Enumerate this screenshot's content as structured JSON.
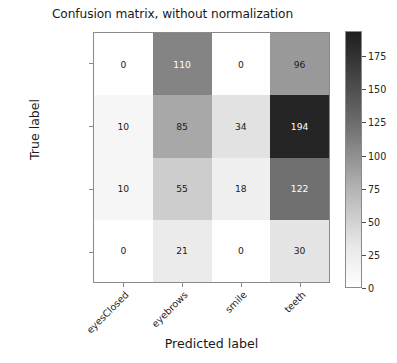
{
  "chart_data": {
    "type": "heatmap",
    "title": "Confusion matrix, without normalization",
    "xlabel": "Predicted label",
    "ylabel": "True label",
    "categories": [
      "eyesClosed",
      "eyebrows",
      "smile",
      "teeth"
    ],
    "x_tick_labels": [
      "eyesClosed",
      "eyebrows",
      "smile",
      "teeth"
    ],
    "y_tick_labels": [
      "eyesClosed",
      "eyebrows",
      "smile",
      "teeth"
    ],
    "rows": [
      {
        "label": "eyesClosed",
        "values": [
          0,
          110,
          0,
          96
        ]
      },
      {
        "label": "eyebrows",
        "values": [
          10,
          85,
          34,
          194
        ]
      },
      {
        "label": "smile",
        "values": [
          10,
          55,
          18,
          122
        ]
      },
      {
        "label": "teeth",
        "values": [
          0,
          21,
          0,
          30
        ]
      }
    ],
    "cells": [
      {
        "row": 0,
        "col": 0,
        "value": 0,
        "text": "0",
        "bg": "#fefefe",
        "fg": "#1a1a1a"
      },
      {
        "row": 0,
        "col": 1,
        "value": 110,
        "text": "110",
        "bg": "#848484",
        "fg": "#ffffff"
      },
      {
        "row": 0,
        "col": 2,
        "value": 0,
        "text": "0",
        "bg": "#fefefe",
        "fg": "#1a1a1a"
      },
      {
        "row": 0,
        "col": 3,
        "value": 96,
        "text": "96",
        "bg": "#999999",
        "fg": "#1a1a1a"
      },
      {
        "row": 1,
        "col": 0,
        "value": 10,
        "text": "10",
        "bg": "#f6f6f6",
        "fg": "#1a1a1a"
      },
      {
        "row": 1,
        "col": 1,
        "value": 85,
        "text": "85",
        "bg": "#a8a8a8",
        "fg": "#1a1a1a"
      },
      {
        "row": 1,
        "col": 2,
        "value": 34,
        "text": "34",
        "bg": "#e2e2e2",
        "fg": "#1a1a1a"
      },
      {
        "row": 1,
        "col": 3,
        "value": 194,
        "text": "194",
        "bg": "#252525",
        "fg": "#ffffff"
      },
      {
        "row": 2,
        "col": 0,
        "value": 10,
        "text": "10",
        "bg": "#f6f6f6",
        "fg": "#1a1a1a"
      },
      {
        "row": 2,
        "col": 1,
        "value": 55,
        "text": "55",
        "bg": "#cdcdcd",
        "fg": "#1a1a1a"
      },
      {
        "row": 2,
        "col": 2,
        "value": 18,
        "text": "18",
        "bg": "#efefef",
        "fg": "#1a1a1a"
      },
      {
        "row": 2,
        "col": 3,
        "value": 122,
        "text": "122",
        "bg": "#707070",
        "fg": "#ffffff"
      },
      {
        "row": 3,
        "col": 0,
        "value": 0,
        "text": "0",
        "bg": "#fefefe",
        "fg": "#1a1a1a"
      },
      {
        "row": 3,
        "col": 1,
        "value": 21,
        "text": "21",
        "bg": "#ebebeb",
        "fg": "#1a1a1a"
      },
      {
        "row": 3,
        "col": 2,
        "value": 0,
        "text": "0",
        "bg": "#fefefe",
        "fg": "#1a1a1a"
      },
      {
        "row": 3,
        "col": 3,
        "value": 30,
        "text": "30",
        "bg": "#e5e5e5",
        "fg": "#1a1a1a"
      }
    ],
    "colormap": "Greys",
    "colorbar": {
      "ticks": [
        175,
        150,
        125,
        100,
        75,
        50,
        25,
        0
      ],
      "tick_labels": [
        "175",
        "150",
        "125",
        "100",
        "75",
        "50",
        "25",
        "0"
      ],
      "vmin": 0,
      "vmax": 194,
      "position": "right",
      "top_color": "#1e1e1e",
      "bottom_color": "#ffffff"
    },
    "grid": false,
    "vmin": 0,
    "vmax": 194
  }
}
